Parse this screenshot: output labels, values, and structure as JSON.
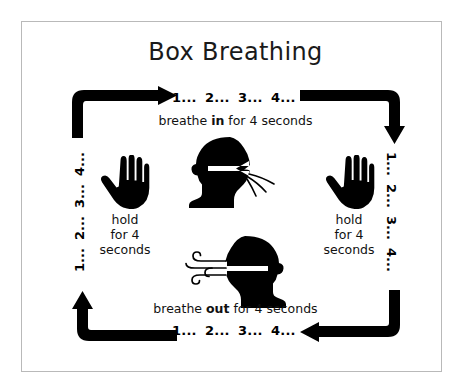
{
  "title": "Box Breathing",
  "counts": {
    "top": [
      "1...",
      "2...",
      "3...",
      "4..."
    ],
    "right": [
      "1...",
      "2...",
      "3...",
      "4..."
    ],
    "bottom": [
      "1...",
      "2...",
      "3...",
      "4..."
    ],
    "left": [
      "1...",
      "2...",
      "3...",
      "4..."
    ]
  },
  "phases": {
    "inhale": {
      "prefix": "breathe ",
      "emphasis": "in",
      "suffix": " for 4 seconds"
    },
    "exhale": {
      "prefix": "breathe ",
      "emphasis": "out",
      "suffix": " for 4 seconds"
    },
    "hold_left": {
      "line1": "hold",
      "line2": "for 4",
      "line3": "seconds"
    },
    "hold_right": {
      "line1": "hold",
      "line2": "for 4",
      "line3": "seconds"
    }
  },
  "icons": {
    "hand_left": "open-hand-icon",
    "hand_right": "open-hand-icon",
    "head_inhale": "head-inhale-icon",
    "head_exhale": "head-exhale-icon",
    "arrow_top_left": "arrow-up-right-icon",
    "arrow_top_right": "arrow-right-down-icon",
    "arrow_bottom_left": "arrow-left-up-icon",
    "arrow_bottom_right": "arrow-down-left-icon"
  },
  "colors": {
    "ink": "#000000",
    "background": "#ffffff",
    "border": "#b9b9b9",
    "title": "#1a1a1a"
  }
}
